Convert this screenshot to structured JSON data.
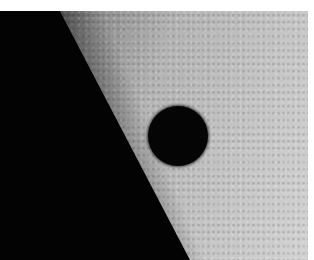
{
  "image": {
    "subject": "planetary transit across solar limb",
    "colors": {
      "space": "#030303",
      "photosphere_light": "#c6c6c6",
      "photosphere_limb": "#3a3a3a",
      "planet_disk": "#050505",
      "border": "#ffffff"
    }
  }
}
